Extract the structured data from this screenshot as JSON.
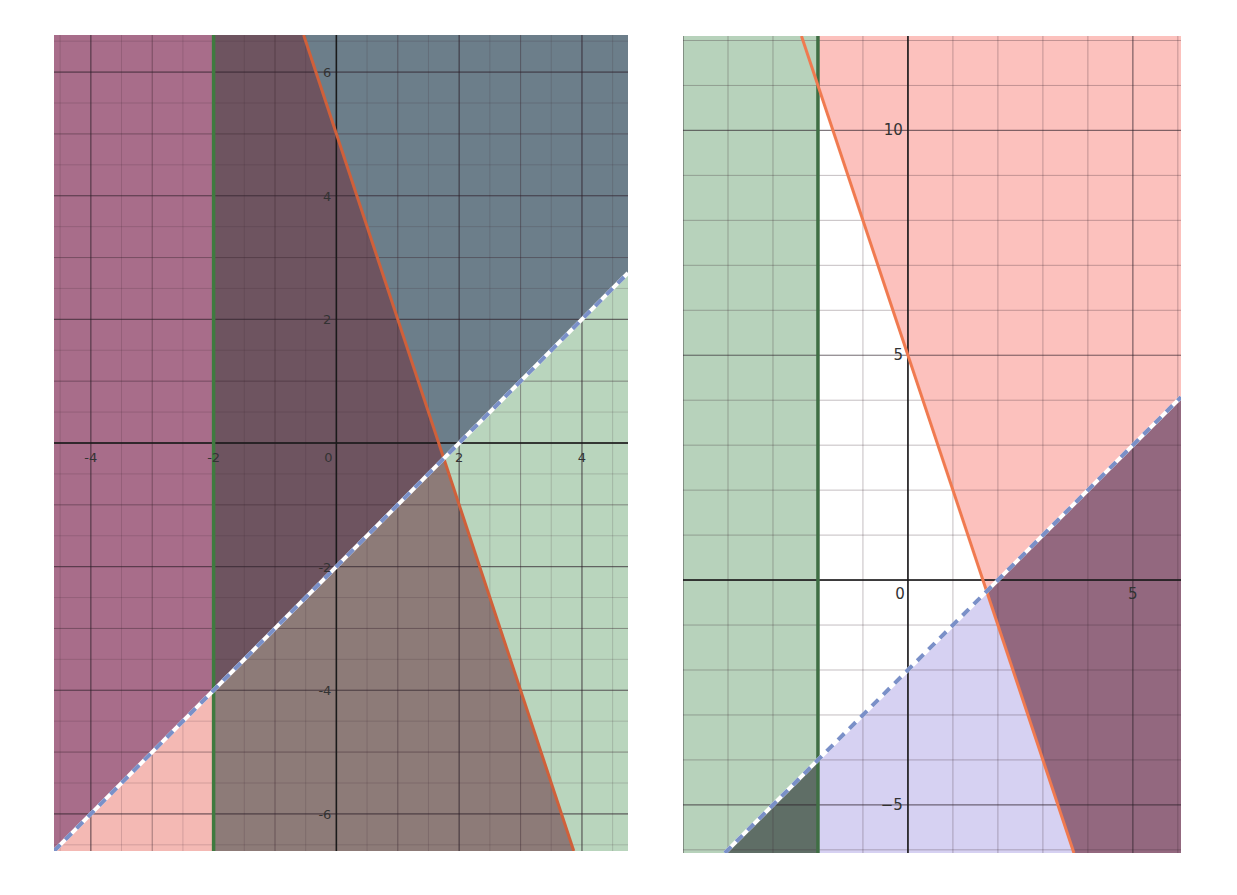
{
  "chart_data": [
    {
      "type": "inequality-region",
      "title": "",
      "xlabel": "",
      "ylabel": "",
      "grid": true,
      "xlim": [
        -4.6,
        4.75
      ],
      "ylim": [
        -6.6,
        6.6
      ],
      "x_ticks": [
        -4,
        -2,
        0,
        2,
        4
      ],
      "x_tick_labels": [
        "-4",
        "-2",
        "0",
        "2",
        "4"
      ],
      "y_ticks": [
        -6,
        -4,
        -2,
        2,
        4,
        6
      ],
      "y_tick_labels": [
        "-6",
        "-4",
        "-2",
        "2",
        "4",
        "6"
      ],
      "minor_grid_step": 0.5,
      "major_grid_step": 1,
      "lines": [
        {
          "name": "x = -2",
          "kind": "vertical",
          "x": -2,
          "style": "solid",
          "color": "#3f7a3f"
        },
        {
          "name": "y = -3x + 5",
          "kind": "line",
          "slope": -3,
          "intercept": 5,
          "style": "solid",
          "color": "#d0603a"
        },
        {
          "name": "y = x - 2",
          "kind": "line",
          "slope": 1,
          "intercept": -2,
          "style": "dashed",
          "color": "#7a90c8"
        }
      ],
      "regions": [
        {
          "name": "x <= -2",
          "color": "#c889a6"
        },
        {
          "name": "y >= -3x + 5",
          "color": "#8a9eaa"
        },
        {
          "name": "y < x - 2",
          "color": "#bcd7c0"
        }
      ],
      "fills": {
        "far_left_upper": "#a86d8a",
        "far_left_lower": "#f4b9b4",
        "center_band_upper": "#6e5460",
        "center_band_lower": "#8d7b78",
        "right_upper": "#6c7e8a",
        "right_lower": "#b9d5bd"
      },
      "intersections": [
        [
          1.75,
          -0.25
        ],
        [
          -2,
          -4
        ],
        [
          -2,
          11
        ]
      ]
    },
    {
      "type": "inequality-region",
      "title": "",
      "xlabel": "",
      "ylabel": "",
      "grid": true,
      "xlim": [
        -5,
        6.07
      ],
      "ylim": [
        -6.07,
        12.1
      ],
      "x_ticks": [
        0,
        5
      ],
      "x_tick_labels": [
        "0",
        "5"
      ],
      "y_ticks": [
        -5,
        5,
        10
      ],
      "y_tick_labels": [
        "−5",
        "5",
        "10"
      ],
      "major_grid_step": 1,
      "lines": [
        {
          "name": "x = -2",
          "kind": "vertical",
          "x": -2,
          "style": "solid",
          "color": "#3f6e44"
        },
        {
          "name": "y = -3x + 5",
          "kind": "line",
          "slope": -3,
          "intercept": 5,
          "style": "solid",
          "color": "#f07a50"
        },
        {
          "name": "y = x - 2",
          "kind": "line",
          "slope": 1,
          "intercept": -2,
          "style": "dashed",
          "color": "#7a90c8"
        }
      ],
      "regions": [
        {
          "name": "x < -2",
          "color": "#b7d2bb"
        },
        {
          "name": "y > -3x + 5",
          "color": "#fcc1bd"
        },
        {
          "name": "y < x - 2",
          "color": "#d6d1f2"
        }
      ],
      "fills": {
        "left_band": "#b7d2bb",
        "left_band_lower_overlap": "#5f6e66",
        "upper_pink": "#fcc1bd",
        "lower_lavender": "#d6d1f2",
        "right_overlap": "#93687f",
        "feasible_white": "#ffffff"
      },
      "intersections": [
        [
          1.75,
          -0.25
        ],
        [
          -2,
          -4
        ],
        [
          -2,
          11
        ]
      ]
    }
  ]
}
